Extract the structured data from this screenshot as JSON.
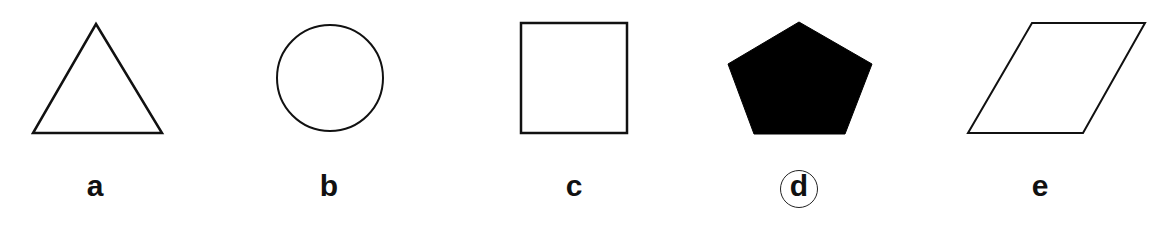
{
  "figure": {
    "options": [
      {
        "label": "a",
        "shape": "triangle",
        "fill": "none",
        "selected": false
      },
      {
        "label": "b",
        "shape": "circle",
        "fill": "none",
        "selected": false
      },
      {
        "label": "c",
        "shape": "square",
        "fill": "none",
        "selected": false
      },
      {
        "label": "d",
        "shape": "pentagon",
        "fill": "black",
        "selected": true
      },
      {
        "label": "e",
        "shape": "parallelogram",
        "fill": "none",
        "selected": false
      }
    ],
    "stroke_color": "#111111",
    "fill_color": "#000000"
  }
}
